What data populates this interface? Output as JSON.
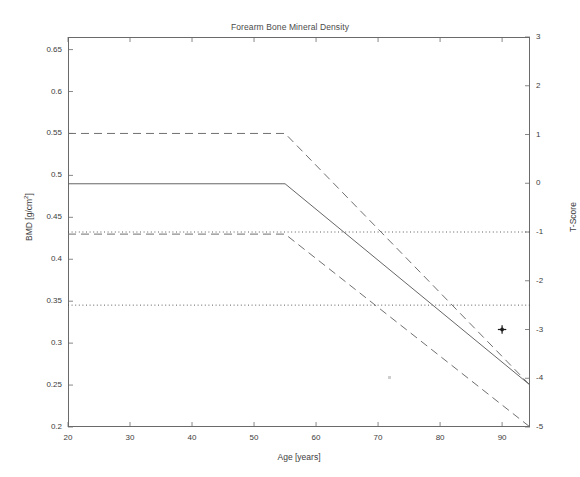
{
  "chart_data": {
    "type": "line",
    "title": "Forearm Bone Mineral Density",
    "xlabel": "Age [years]",
    "ylabel": "BMD [g/cm2]",
    "ylabel_right": "T-Score",
    "xlim": [
      20,
      94.5
    ],
    "ylim": [
      0.2,
      0.665
    ],
    "ylim_right": [
      -5,
      3
    ],
    "grid": false,
    "legend": null,
    "xticks": [
      20,
      30,
      40,
      50,
      60,
      70,
      80,
      90
    ],
    "xticklabels": [
      "20",
      "30",
      "40",
      "50",
      "60",
      "70",
      "80",
      "90"
    ],
    "yticks": [
      0.2,
      0.25,
      0.3,
      0.35,
      0.4,
      0.45,
      0.5,
      0.55,
      0.6,
      0.65
    ],
    "yticklabels": [
      "0.2",
      "0.25",
      "0.3",
      "0.35",
      "0.4",
      "0.45",
      "0.5",
      "0.55",
      "0.6",
      "0.65"
    ],
    "yticks_right": [
      -5,
      -4,
      -3,
      -2,
      -1,
      0,
      1,
      2,
      3
    ],
    "yticklabels_right": [
      "-5",
      "-4",
      "-3",
      "-2",
      "-1",
      "0",
      "1",
      "2",
      "3"
    ],
    "series": [
      {
        "name": "+1 SD reference (T = +1)",
        "style": "dashed",
        "color": "#707070",
        "x": [
          20,
          55,
          94.5
        ],
        "y": [
          0.55,
          0.55,
          0.25
        ],
        "t_score": [
          1,
          1,
          -4
        ]
      },
      {
        "name": "Mean reference (T = 0)",
        "style": "solid",
        "color": "#666666",
        "x": [
          20,
          55,
          94.5
        ],
        "y": [
          0.49,
          0.49,
          0.25
        ],
        "t_score": [
          0,
          0,
          -4
        ]
      },
      {
        "name": "-1 SD reference (T = -1)",
        "style": "dashed",
        "color": "#707070",
        "x": [
          20,
          55,
          94.5
        ],
        "y": [
          0.43,
          0.43,
          0.2
        ],
        "t_score": [
          -1,
          -1,
          -5
        ]
      }
    ],
    "threshold_lines": [
      {
        "name": "osteopenia threshold",
        "style": "dotted",
        "color": "#4d4d4d",
        "t_score": -1,
        "bmd": 0.43
      },
      {
        "name": "osteoporosis threshold",
        "style": "dotted",
        "color": "#4d4d4d",
        "t_score": -2.5,
        "bmd": 0.34
      }
    ],
    "points": [
      {
        "name": "patient measurement",
        "marker": "plus-star",
        "color": "#1a1a1a",
        "x": 90,
        "y": 0.31,
        "t_score": -3
      }
    ],
    "annotations": []
  }
}
